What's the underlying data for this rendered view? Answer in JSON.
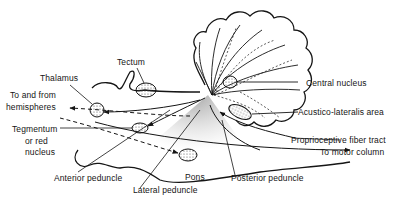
{
  "diagram": {
    "colors": {
      "ink": "#151515",
      "stipple": "#8a8a8a",
      "background": "#ffffff"
    },
    "labels": {
      "tectum": "Tectum",
      "thalamus": "Thalamus",
      "to_from_1": "To and from",
      "to_from_2": "hemispheres",
      "tegmentum_1": "Tegmentum",
      "tegmentum_2": "or red",
      "tegmentum_3": "nucleus",
      "anterior_peduncle": "Anterior peduncle",
      "pons": "Pons",
      "lateral_peduncle": "Lateral peduncle",
      "posterior_peduncle": "Posterior peduncle",
      "central_nucleus": "Central nucleus",
      "acustico_lateralis": "Acustico-lateralis area",
      "proprioceptive": "Proprioceptive fiber tract",
      "to_motor": "To motor column"
    }
  }
}
